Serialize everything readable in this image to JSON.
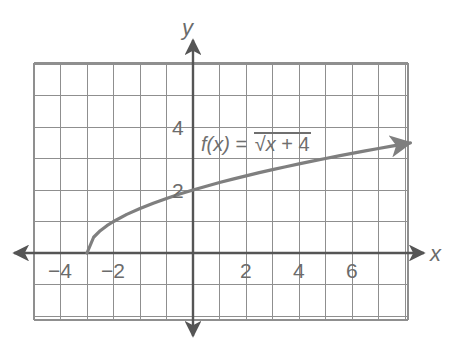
{
  "figure": {
    "kind": "coordinate-graph",
    "background": "#ffffff",
    "grid_color": "#8f8f8f",
    "axis_color": "#555555",
    "curve_color": "#7f7f7f",
    "text_color": "#6b6b6b"
  },
  "axes": {
    "x_axis_label": "x",
    "y_axis_label": "y",
    "x_ticks": [
      {
        "label": "−4",
        "value": -4
      },
      {
        "label": "−2",
        "value": -2
      },
      {
        "label": "2",
        "value": 2
      },
      {
        "label": "4",
        "value": 4
      },
      {
        "label": "6",
        "value": 6
      }
    ],
    "y_ticks": [
      {
        "label": "2",
        "value": 2
      },
      {
        "label": "4",
        "value": 4
      }
    ]
  },
  "function_label": {
    "name": "f(x)",
    "equals": "=",
    "radical_sign": "√",
    "radicand": "x + 4",
    "radicand_var": "x",
    "radicand_rest": " + 4",
    "full_text": "f(x) = √(x + 4)"
  },
  "chart_data": {
    "type": "line",
    "title": "",
    "xlabel": "x",
    "ylabel": "y",
    "expression": "f(x) = sqrt(x + 4)",
    "domain": [
      -4,
      8.2
    ],
    "xlim": [
      -6,
      8.2
    ],
    "ylim": [
      -2,
      6.2
    ],
    "grid": true,
    "grid_step": 1,
    "legend": "none",
    "annotations": [
      {
        "text": "f(x) = √(x + 4)",
        "x": 0.4,
        "y": 3.8
      }
    ],
    "series": [
      {
        "name": "f(x) = sqrt(x + 4)",
        "color": "#7f7f7f",
        "start_arrow": false,
        "end_arrow": true,
        "x": [
          -4,
          -3.75,
          -3.5,
          -3.25,
          -3,
          -2.5,
          -2,
          -1.5,
          -1,
          -0.5,
          0,
          0.5,
          1,
          1.5,
          2,
          2.5,
          3,
          3.5,
          4,
          4.5,
          5,
          5.5,
          6,
          6.5,
          7,
          7.5,
          8,
          8.2
        ],
        "y": [
          0,
          0.5,
          0.707,
          0.866,
          1,
          1.225,
          1.414,
          1.581,
          1.732,
          1.871,
          2,
          2.121,
          2.236,
          2.345,
          2.449,
          2.55,
          2.646,
          2.739,
          2.828,
          2.915,
          3,
          3.082,
          3.162,
          3.24,
          3.317,
          3.391,
          3.464,
          3.493
        ]
      }
    ]
  }
}
